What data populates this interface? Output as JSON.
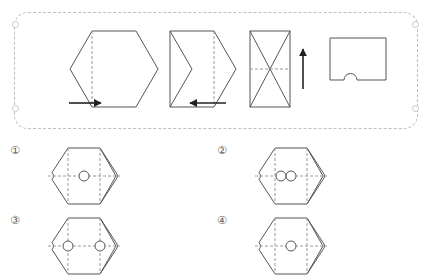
{
  "page": {
    "background_color": "#ffffff",
    "stroke_color": "#555555",
    "dashed_color": "#9a9a9a",
    "frame_color": "#bfbfbf"
  },
  "frame": {
    "name": "question-frame",
    "style": "dashed rounded rectangle",
    "corner_markers": 4
  },
  "sequence": {
    "name": "folding-sequence",
    "steps": [
      {
        "index": 1,
        "shape": "hexagon",
        "description": "Regular hexagon with a vertical dashed fold line near the left vertex",
        "dashed_lines": [
          "vertical-fold-left"
        ],
        "arrow": {
          "direction": "right",
          "glyph": "→",
          "label": "fold-right-arrow"
        }
      },
      {
        "index": 2,
        "shape": "folded-chevron",
        "description": "Hexagon after first fold: left part folded over producing chevron notch on left edge, vertical dashed fold line on the right",
        "dashed_lines": [
          "vertical-fold-right"
        ],
        "arrow": {
          "direction": "left",
          "glyph": "←",
          "label": "fold-left-arrow"
        }
      },
      {
        "index": 3,
        "shape": "rectangle-with-diagonals",
        "description": "Folded stack shown as rectangle with X diagonals and a horizontal dashed fold line through the middle",
        "dashed_lines": [
          "horizontal-fold-middle"
        ],
        "arrow": {
          "direction": "up",
          "glyph": "↑",
          "label": "fold-up-arrow"
        }
      },
      {
        "index": 4,
        "shape": "square-with-bottom-notch",
        "description": "Final folded square with a semicircular notch punched out of the bottom edge",
        "dashed_lines": [],
        "arrow": null
      }
    ]
  },
  "options": {
    "name": "answer-options",
    "items": [
      {
        "id": "option-1",
        "marker": "①",
        "shape": "hexagon",
        "holes": 1,
        "hole_layout": "one circle at center",
        "edge_notches": [
          "left",
          "right"
        ],
        "dashed_lines": [
          "vertical-left",
          "vertical-right",
          "horizontal-middle"
        ]
      },
      {
        "id": "option-2",
        "marker": "②",
        "shape": "hexagon",
        "holes": 2,
        "hole_layout": "two adjacent circles touching, left of center",
        "edge_notches": [
          "left",
          "right"
        ],
        "dashed_lines": [
          "vertical-left",
          "vertical-right",
          "horizontal-middle"
        ]
      },
      {
        "id": "option-3",
        "marker": "③",
        "shape": "hexagon",
        "holes": 2,
        "hole_layout": "two circles spaced apart on the two vertical fold lines",
        "edge_notches": [
          "left",
          "right"
        ],
        "dashed_lines": [
          "vertical-left",
          "vertical-right",
          "horizontal-middle"
        ]
      },
      {
        "id": "option-4",
        "marker": "④",
        "shape": "hexagon",
        "holes": 1,
        "hole_layout": "one circle at center",
        "edge_notches": [
          "left",
          "right"
        ],
        "dashed_lines": [
          "vertical-left",
          "vertical-right",
          "horizontal-middle"
        ]
      }
    ]
  }
}
